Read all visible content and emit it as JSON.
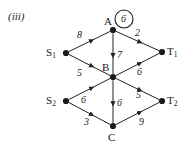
{
  "figure": {
    "part_label": "(iii)",
    "circled_capacity": "6",
    "nodes": [
      {
        "id": "S1",
        "label": "S",
        "sub": "1",
        "x": 66,
        "y": 53,
        "lx": 46,
        "ly": 47
      },
      {
        "id": "S2",
        "label": "S",
        "sub": "2",
        "x": 66,
        "y": 101,
        "lx": 46,
        "ly": 95
      },
      {
        "id": "A",
        "label": "A",
        "sub": "",
        "x": 113,
        "y": 30,
        "lx": 104,
        "ly": 16
      },
      {
        "id": "B",
        "label": "B",
        "sub": "",
        "x": 113,
        "y": 77,
        "lx": 102,
        "ly": 62
      },
      {
        "id": "C",
        "label": "C",
        "sub": "",
        "x": 113,
        "y": 126,
        "lx": 108,
        "ly": 132
      },
      {
        "id": "T1",
        "label": "T",
        "sub": "1",
        "x": 162,
        "y": 52,
        "lx": 167,
        "ly": 46
      },
      {
        "id": "T2",
        "label": "T",
        "sub": "2",
        "x": 162,
        "y": 101,
        "lx": 167,
        "ly": 95
      }
    ],
    "edges": [
      {
        "from": "S1",
        "to": "A",
        "weight": "8",
        "lx": 77,
        "ly": 30
      },
      {
        "from": "S1",
        "to": "B",
        "weight": "5",
        "lx": 77,
        "ly": 68
      },
      {
        "from": "A",
        "to": "B",
        "weight": "7",
        "lx": 117,
        "ly": 50
      },
      {
        "from": "A",
        "to": "T1",
        "weight": "2",
        "lx": 135,
        "ly": 28
      },
      {
        "from": "B",
        "to": "T1",
        "weight": "6",
        "lx": 137,
        "ly": 67
      },
      {
        "from": "S2",
        "to": "B",
        "weight": "6",
        "lx": 81,
        "ly": 95
      },
      {
        "from": "S2",
        "to": "C",
        "weight": "3",
        "lx": 84,
        "ly": 117
      },
      {
        "from": "B",
        "to": "C",
        "weight": "6",
        "lx": 117,
        "ly": 98
      },
      {
        "from": "B",
        "to": "T2",
        "weight": "5",
        "lx": 136,
        "ly": 90
      },
      {
        "from": "C",
        "to": "T2",
        "weight": "9",
        "lx": 139,
        "ly": 117
      }
    ],
    "circle_marker": {
      "cx": 124,
      "cy": 19,
      "r": 9
    },
    "colors": {
      "ink": "#1a1a1a",
      "edge": "#222222"
    }
  }
}
